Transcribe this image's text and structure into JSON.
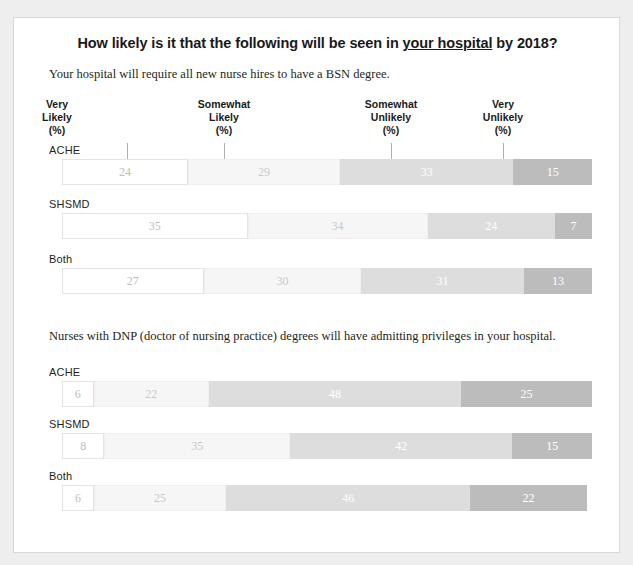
{
  "title": {
    "before": "How likely is it that the following will be seen in ",
    "underlined": "your hospital",
    "after": " by 2018?"
  },
  "columns": [
    {
      "line1": "Very",
      "line2": "Likely",
      "line3": "(%)"
    },
    {
      "line1": "Somewhat",
      "line2": "Likely",
      "line3": "(%)"
    },
    {
      "line1": "Somewhat",
      "line2": "Unlikely",
      "line3": "(%)"
    },
    {
      "line1": "Very",
      "line2": "Unlikely",
      "line3": "(%)"
    }
  ],
  "groups": [
    {
      "subtitle": "Your hospital will require all new nurse hires to have a BSN degree.",
      "rows": [
        {
          "label": "ACHE",
          "values": [
            24,
            29,
            33,
            15
          ]
        },
        {
          "label": "SHSMD",
          "values": [
            35,
            34,
            24,
            7
          ]
        },
        {
          "label": "Both",
          "values": [
            27,
            30,
            31,
            13
          ]
        }
      ]
    },
    {
      "subtitle": "Nurses with DNP (doctor of nursing practice) degrees will have admitting privileges in your hospital.",
      "rows": [
        {
          "label": "ACHE",
          "values": [
            6,
            22,
            48,
            25
          ]
        },
        {
          "label": "SHSMD",
          "values": [
            8,
            35,
            42,
            15
          ]
        },
        {
          "label": "Both",
          "values": [
            6,
            25,
            46,
            22
          ]
        }
      ]
    }
  ],
  "chart_data": {
    "type": "bar",
    "title": "How likely is it that the following will be seen in your hospital by 2018?",
    "xlabel": "",
    "ylabel": "",
    "xlim": [
      0,
      100
    ],
    "grid": false,
    "legend_position": "top",
    "orientation": "horizontal-stacked",
    "categories": [
      "Very Likely (%)",
      "Somewhat Likely (%)",
      "Somewhat Unlikely (%)",
      "Very Unlikely (%)"
    ],
    "panels": [
      {
        "subtitle": "Your hospital will require all new nurse hires to have a BSN degree.",
        "series": [
          {
            "name": "ACHE",
            "values": [
              24,
              29,
              33,
              15
            ]
          },
          {
            "name": "SHSMD",
            "values": [
              35,
              34,
              24,
              7
            ]
          },
          {
            "name": "Both",
            "values": [
              27,
              30,
              31,
              13
            ]
          }
        ]
      },
      {
        "subtitle": "Nurses with DNP (doctor of nursing practice) degrees will have admitting privileges in your hospital.",
        "series": [
          {
            "name": "ACHE",
            "values": [
              6,
              22,
              48,
              25
            ]
          },
          {
            "name": "SHSMD",
            "values": [
              8,
              35,
              42,
              15
            ]
          },
          {
            "name": "Both",
            "values": [
              6,
              25,
              46,
              22
            ]
          }
        ]
      }
    ],
    "colors": [
      "#ffffff",
      "#f6f6f6",
      "#dddddd",
      "#bcbcbc"
    ]
  }
}
